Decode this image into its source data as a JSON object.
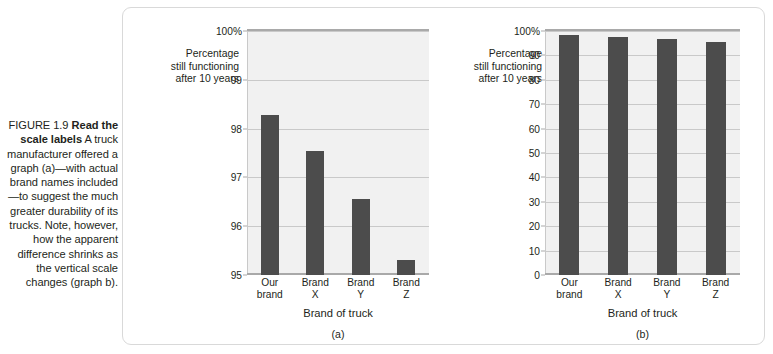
{
  "figure": {
    "number_label": "FIGURE 1.9",
    "lead_in": "Read the scale labels",
    "body": " A truck manufacturer offered a graph (a)—with actual brand names included—to suggest the much greater durability of its trucks. Note, however, how the apparent difference shrinks as the vertical scale changes (graph b)."
  },
  "chart_data": [
    {
      "type": "bar",
      "panel": "(a)",
      "title": "",
      "ylabel": "Percentage still functioning after 10 years",
      "xlabel": "Brand of truck",
      "categories": [
        "Our brand",
        "Brand X",
        "Brand Y",
        "Brand Z"
      ],
      "values": [
        98.27,
        97.55,
        96.55,
        95.3
      ],
      "ylim": [
        95,
        100
      ],
      "yticks": [
        95,
        96,
        97,
        98,
        99,
        100
      ],
      "ytick_labels": [
        "95",
        "96",
        "97",
        "98",
        "99",
        "100%"
      ],
      "grid": true,
      "legend": "none",
      "bar_color": "#4c4c4c",
      "plot_background": "#f1f1f1"
    },
    {
      "type": "bar",
      "panel": "(b)",
      "title": "",
      "ylabel": "Percentage still functioning after 10 years",
      "xlabel": "Brand of truck",
      "categories": [
        "Our brand",
        "Brand X",
        "Brand Y",
        "Brand Z"
      ],
      "values": [
        98.3,
        97.6,
        96.6,
        95.3
      ],
      "ylim": [
        0,
        100
      ],
      "yticks": [
        0,
        10,
        20,
        30,
        40,
        50,
        60,
        70,
        80,
        90,
        100
      ],
      "ytick_labels": [
        "0",
        "10",
        "20",
        "30",
        "40",
        "50",
        "60",
        "70",
        "80",
        "90",
        "100%"
      ],
      "grid": true,
      "legend": "none",
      "bar_color": "#4c4c4c",
      "plot_background": "#f1f1f1"
    }
  ],
  "chart_a": {
    "ylabel_line1": "Percentage",
    "ylabel_line2": "still functioning",
    "ylabel_line3": "after 10 years",
    "xtitle": "Brand of truck",
    "panel_letter": "(a)"
  },
  "chart_b": {
    "ylabel_line1": "Percentage",
    "ylabel_line2": "still functioning",
    "ylabel_line3": "after 10 years",
    "xtitle": "Brand of truck",
    "panel_letter": "(b)"
  }
}
